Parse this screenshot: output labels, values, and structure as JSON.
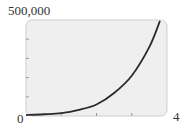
{
  "chart_data": {
    "type": "line",
    "title": "",
    "xlabel": "",
    "ylabel": "",
    "xlim": [
      0,
      4
    ],
    "ylim": [
      0,
      500000
    ],
    "x_tick_labels": [
      "0",
      "4"
    ],
    "y_tick_labels": [
      "500,000"
    ],
    "x_ticks": [
      0,
      1,
      2,
      3,
      4
    ],
    "y_ticks": [
      0,
      100000,
      200000,
      300000,
      400000,
      500000
    ],
    "grid": false,
    "series": [
      {
        "name": "exponential growth",
        "x": [
          0,
          0.5,
          1,
          1.5,
          2,
          2.5,
          3,
          3.5,
          3.8
        ],
        "y": [
          5000,
          9000,
          15000,
          32000,
          60000,
          120000,
          210000,
          360000,
          495000
        ]
      }
    ],
    "colors": {
      "plot_background": "#efefef",
      "line": "#2a2a2a",
      "border": "#cfcfcf"
    }
  },
  "labels": {
    "y_max": "500,000",
    "x_min": "0",
    "x_max": "4"
  }
}
